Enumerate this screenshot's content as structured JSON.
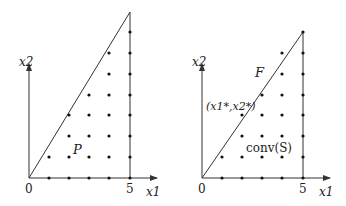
{
  "panels": [
    {
      "name": "left",
      "axis_x_label": "x1",
      "axis_y_label": "x2",
      "tick_0": "0",
      "tick_5": "5",
      "region_label": "P"
    },
    {
      "name": "right",
      "axis_x_label": "x1",
      "axis_y_label": "x2",
      "tick_0": "0",
      "tick_5": "5",
      "face_label": "F",
      "optimum_label": "(x1*,x2*)",
      "hull_label": "conv(S)"
    }
  ],
  "colors": {
    "line": "#333333",
    "dot": "#111111"
  }
}
